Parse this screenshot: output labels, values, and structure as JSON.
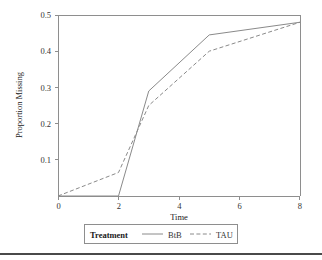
{
  "chart_data": {
    "type": "line",
    "title": "",
    "xlabel": "Time",
    "ylabel": "Proportion Missing",
    "xlim": [
      0,
      8
    ],
    "ylim": [
      0,
      0.5
    ],
    "xticks": [
      0,
      2,
      4,
      6,
      8
    ],
    "xtick_labels": [
      "0",
      "2",
      "4",
      "6",
      "8"
    ],
    "yticks": [
      0.0,
      0.1,
      0.2,
      0.3,
      0.4,
      0.5
    ],
    "ytick_labels": [
      "0.0",
      "0.1",
      "0.2",
      "0.3",
      "0.4",
      "0.5"
    ],
    "ytick_labels_shown": [
      "0.1",
      "0.2",
      "0.3",
      "0.4",
      "0.5"
    ],
    "grid": false,
    "legend_position": "bottom",
    "legend_title": "Treatment",
    "x": [
      0,
      2,
      3,
      5,
      8
    ],
    "series": [
      {
        "name": "BtB",
        "style": "solid",
        "color": "#8a8a8a",
        "values": [
          0.0,
          0.0,
          0.29,
          0.445,
          0.48
        ]
      },
      {
        "name": "TAU",
        "style": "dashed",
        "color": "#8a8a8a",
        "values": [
          0.0,
          0.065,
          0.25,
          0.4,
          0.48
        ]
      }
    ]
  },
  "axes": {
    "y_title": "Proportion Missing",
    "x_title": "Time",
    "y_labels": [
      {
        "value": "0.5",
        "v": 0.5
      },
      {
        "value": "0.4",
        "v": 0.4
      },
      {
        "value": "0.3",
        "v": 0.3
      },
      {
        "value": "0.2",
        "v": 0.2
      },
      {
        "value": "0.1",
        "v": 0.1
      }
    ],
    "x_labels": [
      {
        "value": "0",
        "v": 0
      },
      {
        "value": "2",
        "v": 2
      },
      {
        "value": "4",
        "v": 4
      },
      {
        "value": "6",
        "v": 6
      },
      {
        "value": "8",
        "v": 8
      }
    ]
  },
  "legend": {
    "title": "Treatment",
    "entries": [
      {
        "label": "BtB",
        "style": "solid"
      },
      {
        "label": "TAU",
        "style": "dashed"
      }
    ]
  }
}
